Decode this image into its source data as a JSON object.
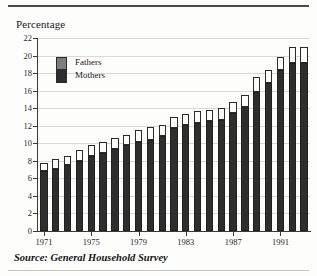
{
  "chart_title": "Percentage",
  "source_note": "Source: General Household Survey",
  "legend": {
    "position": "inside-top-left",
    "items": [
      {
        "label": "Fathers",
        "color": "#fbfbfa"
      },
      {
        "label": "Mothers",
        "color": "#2e2e2e"
      }
    ]
  },
  "colors": {
    "mothers": "#2e2e2e",
    "fathers": "#fbfbfa",
    "outline": "#2b2b2b",
    "grid": "#d9d9d6",
    "axis": "#3a3a3a",
    "background": "#fdfdfc"
  },
  "chart_data": {
    "type": "bar",
    "subtype": "stacked-vertical",
    "title": "Percentage",
    "xlabel": "",
    "ylabel": "Percentage",
    "ylim": [
      0,
      22
    ],
    "ytick_step": 2,
    "yticks": [
      0,
      2,
      4,
      6,
      8,
      10,
      12,
      14,
      16,
      18,
      20,
      22
    ],
    "grid": true,
    "grid_axis": "y",
    "legend_position": "inside top-left",
    "categories": [
      "1971",
      "1972",
      "1973",
      "1974",
      "1975",
      "1976",
      "1977",
      "1978",
      "1979",
      "1980",
      "1981",
      "1982",
      "1983",
      "1984",
      "1985",
      "1986",
      "1987",
      "1988",
      "1989",
      "1990",
      "1991",
      "1992",
      "1993"
    ],
    "xtick_labels": [
      "1971",
      "1975",
      "1979",
      "1983",
      "1987",
      "1991"
    ],
    "xtick_categories": [
      "1971",
      "1975",
      "1979",
      "1983",
      "1987",
      "1991"
    ],
    "series": [
      {
        "name": "Mothers",
        "color": "#2e2e2e",
        "values": [
          6.8,
          7.1,
          7.5,
          8.0,
          8.6,
          8.9,
          9.4,
          9.8,
          10.2,
          10.4,
          10.8,
          11.7,
          12.1,
          12.3,
          12.5,
          12.6,
          13.4,
          14.1,
          15.9,
          16.9,
          18.3,
          19.2,
          19.2
        ]
      },
      {
        "name": "Fathers",
        "color": "#fbfbfa",
        "values": [
          1.0,
          1.1,
          1.1,
          1.2,
          1.2,
          1.3,
          1.2,
          1.2,
          1.3,
          1.5,
          1.3,
          1.3,
          1.2,
          1.4,
          1.3,
          1.4,
          1.3,
          1.4,
          1.6,
          1.5,
          1.5,
          1.8,
          1.8
        ]
      }
    ],
    "totals": [
      7.8,
      8.2,
      8.6,
      9.2,
      9.8,
      10.2,
      10.6,
      11.0,
      11.5,
      11.9,
      12.1,
      13.0,
      13.3,
      13.7,
      13.8,
      14.0,
      14.7,
      15.5,
      17.5,
      18.4,
      19.8,
      21.0,
      21.0
    ],
    "annotations": [
      "Source: General Household Survey"
    ]
  }
}
